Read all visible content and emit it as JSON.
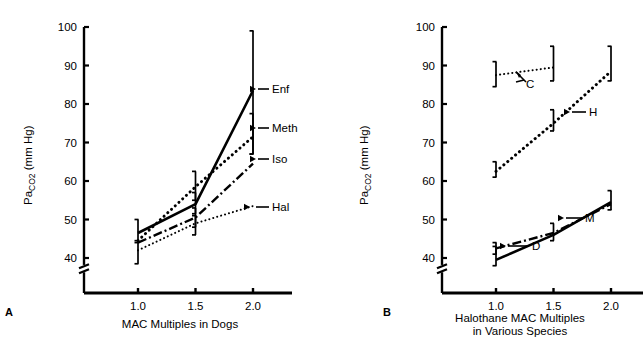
{
  "figure": {
    "panels": [
      {
        "letter": "A",
        "xlabel": "MAC Multiples in Dogs",
        "ylabel_main": "Pa",
        "ylabel_sub1": "CO",
        "ylabel_sub2": "2",
        "ylabel_tail": " (mm Hg)"
      },
      {
        "letter": "B",
        "xlabel": "Halothane MAC Multiples\nin Various Species",
        "ylabel_main": "Pa",
        "ylabel_sub1": "CO",
        "ylabel_sub2": "2",
        "ylabel_tail": " (mm Hg)"
      }
    ]
  },
  "chart_data": [
    {
      "type": "line",
      "panel": "A",
      "title": "",
      "xlabel": "MAC Multiples in Dogs",
      "ylabel": "PaCO2 (mm Hg)",
      "x": [
        1.0,
        1.5,
        2.0
      ],
      "xticklabels": [
        "1.0",
        "1.5",
        "2.0"
      ],
      "xlim": [
        0.75,
        2.25
      ],
      "ylim": [
        36,
        100
      ],
      "yticks": [
        40,
        50,
        60,
        70,
        80,
        90,
        100
      ],
      "yticklabels": [
        "40",
        "50",
        "60",
        "70",
        "80",
        "90",
        "100"
      ],
      "axis_break": true,
      "grid": false,
      "legend": "inline-labels-right",
      "series": [
        {
          "name": "Enf",
          "label": "Enf",
          "style": "solid",
          "values": [
            46.5,
            54.0,
            83.5
          ],
          "errors_low": [
            44.5,
            51.5,
            67.0
          ],
          "errors_high": [
            50.0,
            57.0,
            99.0
          ],
          "error_at": [
            1.0,
            1.5,
            2.0
          ]
        },
        {
          "name": "Meth",
          "label": "Meth",
          "style": "dotted-thick",
          "values": [
            44.5,
            58.5,
            71.5
          ],
          "errors_low": [
            42.5,
            55.0,
            67.0
          ],
          "errors_high": [
            46.0,
            62.5,
            77.5
          ],
          "error_at": [
            1.5,
            2.0
          ]
        },
        {
          "name": "Iso",
          "label": "Iso",
          "style": "dash-dot",
          "values": [
            44.0,
            50.5,
            64.5
          ],
          "errors_low": [
            42.0,
            48.0,
            61.0
          ],
          "errors_high": [
            46.5,
            53.0,
            68.0
          ],
          "error_at": [
            1.5
          ]
        },
        {
          "name": "Hal",
          "label": "Hal",
          "style": "dotted-fine",
          "values": [
            42.0,
            49.0,
            53.5
          ],
          "errors_low": [
            38.5,
            46.0,
            51.5
          ],
          "errors_high": [
            44.0,
            51.0,
            56.0
          ],
          "error_at": [
            1.0,
            1.5
          ]
        }
      ]
    },
    {
      "type": "line",
      "panel": "B",
      "title": "",
      "xlabel": "Halothane MAC Multiples in Various Species",
      "ylabel": "PaCO2 (mm Hg)",
      "x": [
        1.0,
        1.5,
        2.0
      ],
      "xticklabels": [
        "1.0",
        "1.5",
        "2.0"
      ],
      "xlim": [
        0.75,
        2.25
      ],
      "ylim": [
        36,
        100
      ],
      "yticks": [
        40,
        50,
        60,
        70,
        80,
        90,
        100
      ],
      "yticklabels": [
        "40",
        "50",
        "60",
        "70",
        "80",
        "90",
        "100"
      ],
      "axis_break": true,
      "grid": false,
      "legend": "inline-arrow-labels",
      "series": [
        {
          "name": "C",
          "label": "C",
          "style": "dotted-fine",
          "x": [
            1.0,
            1.5
          ],
          "values": [
            87.5,
            89.5
          ],
          "errors_low": [
            84.5,
            86.0
          ],
          "errors_high": [
            91.0,
            95.0
          ],
          "error_at": [
            1.0,
            1.5
          ]
        },
        {
          "name": "H",
          "label": "H",
          "style": "dotted-thick",
          "x": [
            1.0,
            1.5,
            2.0
          ],
          "values": [
            62.5,
            75.0,
            88.5
          ],
          "errors_low": [
            61.0,
            73.0,
            86.0
          ],
          "errors_high": [
            65.0,
            78.5,
            95.0
          ],
          "error_at": [
            1.0,
            1.5,
            2.0
          ]
        },
        {
          "name": "M",
          "label": "M",
          "style": "dash-dot",
          "x": [
            1.0,
            1.5,
            2.0
          ],
          "values": [
            42.5,
            46.5,
            54.0
          ],
          "errors_low": [
            41.0,
            44.5,
            52.5
          ],
          "errors_high": [
            44.0,
            49.0,
            57.5
          ],
          "error_at": [
            1.0,
            1.5
          ]
        },
        {
          "name": "D",
          "label": "D",
          "style": "solid",
          "x": [
            1.0,
            1.5,
            2.0
          ],
          "values": [
            39.5,
            46.0,
            54.5
          ],
          "errors_low": [
            38.0,
            44.0,
            52.5
          ],
          "errors_high": [
            43.0,
            49.0,
            57.5
          ],
          "error_at": [
            1.0,
            2.0
          ]
        }
      ]
    }
  ]
}
